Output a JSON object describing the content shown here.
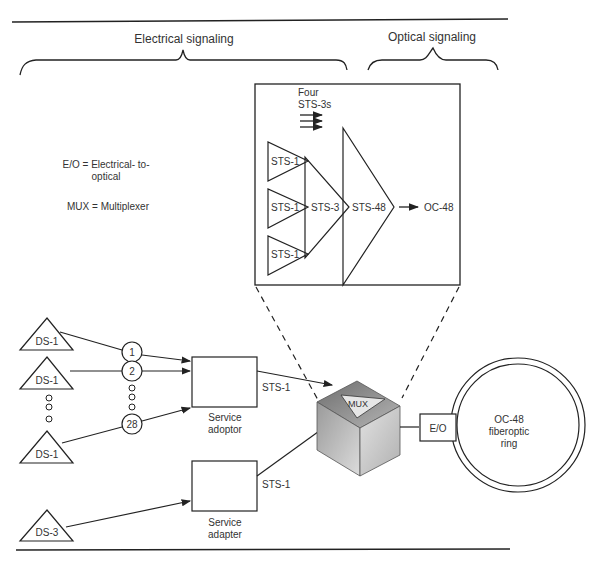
{
  "headers": {
    "electrical": "Electrical signaling",
    "optical": "Optical signaling"
  },
  "legend": {
    "eo_line1": "E/O = Electrical- to-",
    "eo_line2": "optical",
    "mux": "MUX = Multiplexer"
  },
  "detail": {
    "four_label_1": "Four",
    "four_label_2": "STS-3s",
    "sts1_labels": [
      "STS-1",
      "STS-1",
      "STS-1"
    ],
    "sts3": "STS-3",
    "sts48": "STS-48",
    "output": "OC-48"
  },
  "sources": {
    "ds1": [
      "DS-1",
      "DS-1",
      "DS-1"
    ],
    "ds3": "DS-3",
    "channels": [
      "1",
      "2",
      "28"
    ]
  },
  "adapters": {
    "top_label_1": "Service",
    "top_label_2": "adoptor",
    "bottom_label_1": "Service",
    "bottom_label_2": "adapter",
    "top_output": "STS-1",
    "bottom_output": "STS-1"
  },
  "mux": {
    "label": "MUX"
  },
  "eo": {
    "label": "E/O"
  },
  "ring": {
    "line1": "OC-48",
    "line2": "fiberoptic",
    "line3": "ring"
  }
}
